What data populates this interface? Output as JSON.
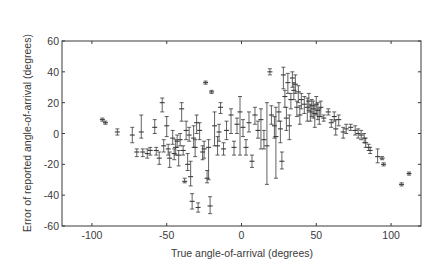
{
  "chart_data": {
    "type": "scatter",
    "subtype": "errorbar",
    "title": "",
    "xlabel": "True angle-of-arrival (degrees)",
    "ylabel": "Error of reported angle-of-arrival (degrees)",
    "xlim": [
      -120,
      120
    ],
    "ylim": [
      -60,
      60
    ],
    "xticks": [
      -100,
      -50,
      0,
      50,
      100
    ],
    "yticks": [
      -60,
      -40,
      -20,
      0,
      20,
      40,
      60
    ],
    "xtick_labels": [
      "-100",
      "-50",
      "0",
      "50",
      "100"
    ],
    "ytick_labels": [
      "-60",
      "-40",
      "-20",
      "0",
      "20",
      "40",
      "60"
    ],
    "grid": false,
    "legend": null,
    "series": [
      {
        "name": "measurements",
        "color": "#3a3a3a",
        "points": [
          {
            "x": -93,
            "y": 9,
            "lo": 8,
            "hi": 10
          },
          {
            "x": -91,
            "y": 7,
            "lo": 6,
            "hi": 8
          },
          {
            "x": -83,
            "y": 1,
            "lo": -1,
            "hi": 3
          },
          {
            "x": -73,
            "y": -1,
            "lo": -6,
            "hi": 4
          },
          {
            "x": -70,
            "y": -12,
            "lo": -15,
            "hi": -10
          },
          {
            "x": -67,
            "y": 1,
            "lo": -3,
            "hi": 12
          },
          {
            "x": -66,
            "y": -12,
            "lo": -15,
            "hi": -10
          },
          {
            "x": -63,
            "y": -13,
            "lo": -16,
            "hi": -10
          },
          {
            "x": -61,
            "y": -11,
            "lo": -14,
            "hi": -9
          },
          {
            "x": -58,
            "y": 4,
            "lo": 0,
            "hi": 9
          },
          {
            "x": -57,
            "y": -11,
            "lo": -14,
            "hi": -9
          },
          {
            "x": -55,
            "y": -16,
            "lo": -20,
            "hi": -12
          },
          {
            "x": -53,
            "y": 20,
            "lo": 14,
            "hi": 23
          },
          {
            "x": -52,
            "y": -8,
            "lo": -12,
            "hi": -4
          },
          {
            "x": -50,
            "y": 5,
            "lo": -2,
            "hi": 11
          },
          {
            "x": -49,
            "y": -10,
            "lo": -14,
            "hi": -7
          },
          {
            "x": -48,
            "y": -16,
            "lo": -22,
            "hi": -12
          },
          {
            "x": -46,
            "y": -3,
            "lo": -7,
            "hi": 2
          },
          {
            "x": -45,
            "y": -13,
            "lo": -17,
            "hi": -10
          },
          {
            "x": -44,
            "y": -9,
            "lo": -14,
            "hi": -4
          },
          {
            "x": -43,
            "y": -5,
            "lo": -9,
            "hi": -1
          },
          {
            "x": -42,
            "y": -14,
            "lo": -21,
            "hi": -11
          },
          {
            "x": -41,
            "y": -4,
            "lo": -8,
            "hi": 0
          },
          {
            "x": -40,
            "y": 16,
            "lo": 8,
            "hi": 20
          },
          {
            "x": -39,
            "y": -11,
            "lo": -14,
            "hi": -8
          },
          {
            "x": -38,
            "y": -31,
            "lo": -32,
            "hi": -29
          },
          {
            "x": -37,
            "y": 2,
            "lo": -4,
            "hi": 8
          },
          {
            "x": -36,
            "y": -20,
            "lo": -24,
            "hi": -13
          },
          {
            "x": -35,
            "y": -1,
            "lo": -5,
            "hi": 4
          },
          {
            "x": -34,
            "y": -28,
            "lo": -34,
            "hi": -18
          },
          {
            "x": -33,
            "y": -44,
            "lo": -49,
            "hi": -39
          },
          {
            "x": -32,
            "y": -3,
            "lo": -9,
            "hi": 5
          },
          {
            "x": -31,
            "y": -9,
            "lo": -15,
            "hi": -4
          },
          {
            "x": -30,
            "y": 7,
            "lo": 0,
            "hi": 12
          },
          {
            "x": -29,
            "y": -48,
            "lo": -51,
            "hi": -45
          },
          {
            "x": -28,
            "y": 2,
            "lo": -4,
            "hi": 7
          },
          {
            "x": -26,
            "y": -12,
            "lo": -17,
            "hi": -8
          },
          {
            "x": -25,
            "y": -10,
            "lo": -16,
            "hi": -5
          },
          {
            "x": -24,
            "y": 33,
            "lo": 32,
            "hi": 34
          },
          {
            "x": -23,
            "y": -29,
            "lo": -32,
            "hi": -24
          },
          {
            "x": -22,
            "y": -9,
            "lo": -30,
            "hi": -4
          },
          {
            "x": -21,
            "y": -47,
            "lo": -52,
            "hi": -41
          },
          {
            "x": -20,
            "y": 27,
            "lo": 26,
            "hi": 28
          },
          {
            "x": -18,
            "y": 5,
            "lo": -8,
            "hi": 14
          },
          {
            "x": -16,
            "y": -8,
            "lo": -14,
            "hi": -2
          },
          {
            "x": -15,
            "y": 1,
            "lo": -5,
            "hi": 6
          },
          {
            "x": -14,
            "y": 17,
            "lo": 13,
            "hi": 20
          },
          {
            "x": -12,
            "y": -10,
            "lo": -14,
            "hi": -6
          },
          {
            "x": -10,
            "y": 2,
            "lo": -4,
            "hi": 8
          },
          {
            "x": -7,
            "y": 12,
            "lo": 0,
            "hi": 16
          },
          {
            "x": -5,
            "y": -9,
            "lo": -14,
            "hi": -5
          },
          {
            "x": -3,
            "y": 6,
            "lo": 0,
            "hi": 10
          },
          {
            "x": -1,
            "y": 14,
            "lo": -14,
            "hi": 24
          },
          {
            "x": 1,
            "y": 4,
            "lo": -2,
            "hi": 9
          },
          {
            "x": 3,
            "y": -9,
            "lo": -14,
            "hi": -4
          },
          {
            "x": 5,
            "y": 7,
            "lo": 1,
            "hi": 14
          },
          {
            "x": 7,
            "y": -18,
            "lo": -22,
            "hi": -14
          },
          {
            "x": 9,
            "y": 12,
            "lo": 6,
            "hi": 17
          },
          {
            "x": 11,
            "y": 2,
            "lo": -3,
            "hi": 8
          },
          {
            "x": 13,
            "y": 9,
            "lo": -10,
            "hi": 16
          },
          {
            "x": 15,
            "y": -4,
            "lo": -10,
            "hi": 2
          },
          {
            "x": 17,
            "y": -8,
            "lo": -33,
            "hi": 20
          },
          {
            "x": 19,
            "y": 40,
            "lo": 38,
            "hi": 42
          },
          {
            "x": 20,
            "y": 12,
            "lo": 6,
            "hi": 18
          },
          {
            "x": 22,
            "y": 5,
            "lo": -3,
            "hi": 11
          },
          {
            "x": 23,
            "y": -2,
            "lo": -29,
            "hi": 17
          },
          {
            "x": 25,
            "y": 14,
            "lo": 8,
            "hi": 20
          },
          {
            "x": 26,
            "y": 3,
            "lo": -6,
            "hi": 8
          },
          {
            "x": 27,
            "y": -18,
            "lo": -23,
            "hi": -12
          },
          {
            "x": 28,
            "y": 38,
            "lo": 29,
            "hi": 43
          },
          {
            "x": 29,
            "y": 24,
            "lo": 17,
            "hi": 28
          },
          {
            "x": 30,
            "y": 10,
            "lo": 2,
            "hi": 17
          },
          {
            "x": 31,
            "y": 33,
            "lo": 26,
            "hi": 39
          },
          {
            "x": 32,
            "y": 5,
            "lo": -4,
            "hi": 12
          },
          {
            "x": 33,
            "y": 22,
            "lo": 16,
            "hi": 26
          },
          {
            "x": 34,
            "y": 36,
            "lo": 30,
            "hi": 40
          },
          {
            "x": 35,
            "y": 28,
            "lo": 22,
            "hi": 33
          },
          {
            "x": 36,
            "y": 32,
            "lo": 26,
            "hi": 38
          },
          {
            "x": 37,
            "y": 17,
            "lo": 11,
            "hi": 21
          },
          {
            "x": 38,
            "y": 27,
            "lo": 20,
            "hi": 31
          },
          {
            "x": 39,
            "y": 12,
            "lo": 6,
            "hi": 18
          },
          {
            "x": 40,
            "y": 22,
            "lo": 16,
            "hi": 26
          },
          {
            "x": 42,
            "y": 19,
            "lo": 13,
            "hi": 24
          },
          {
            "x": 44,
            "y": 17,
            "lo": 8,
            "hi": 23
          },
          {
            "x": 45,
            "y": 21,
            "lo": 15,
            "hi": 26
          },
          {
            "x": 46,
            "y": 14,
            "lo": 8,
            "hi": 19
          },
          {
            "x": 47,
            "y": 18,
            "lo": 11,
            "hi": 22
          },
          {
            "x": 48,
            "y": 16,
            "lo": 10,
            "hi": 21
          },
          {
            "x": 49,
            "y": 13,
            "lo": 4,
            "hi": 18
          },
          {
            "x": 50,
            "y": 19,
            "lo": 12,
            "hi": 24
          },
          {
            "x": 51,
            "y": 15,
            "lo": 9,
            "hi": 20
          },
          {
            "x": 52,
            "y": 11,
            "lo": 6,
            "hi": 16
          },
          {
            "x": 53,
            "y": 17,
            "lo": 11,
            "hi": 21
          },
          {
            "x": 55,
            "y": 10,
            "lo": 8,
            "hi": 12
          },
          {
            "x": 58,
            "y": 14,
            "lo": 12,
            "hi": 16
          },
          {
            "x": 60,
            "y": 7,
            "lo": 4,
            "hi": 9
          },
          {
            "x": 62,
            "y": 11,
            "lo": 8,
            "hi": 14
          },
          {
            "x": 63,
            "y": 3,
            "lo": -1,
            "hi": 9
          },
          {
            "x": 65,
            "y": 9,
            "lo": 5,
            "hi": 12
          },
          {
            "x": 68,
            "y": 1,
            "lo": -3,
            "hi": 4
          },
          {
            "x": 70,
            "y": 3,
            "lo": 0,
            "hi": 6
          },
          {
            "x": 73,
            "y": 4,
            "lo": 2,
            "hi": 6
          },
          {
            "x": 76,
            "y": 2,
            "lo": -1,
            "hi": 5
          },
          {
            "x": 78,
            "y": 0,
            "lo": -3,
            "hi": 3
          },
          {
            "x": 80,
            "y": -1,
            "lo": -4,
            "hi": 2
          },
          {
            "x": 82,
            "y": -3,
            "lo": -6,
            "hi": 0
          },
          {
            "x": 83,
            "y": -6,
            "lo": -9,
            "hi": -3
          },
          {
            "x": 85,
            "y": -9,
            "lo": -11,
            "hi": -7
          },
          {
            "x": 86,
            "y": -11,
            "lo": -13,
            "hi": -9
          },
          {
            "x": 91,
            "y": -15,
            "lo": -19,
            "hi": -10
          },
          {
            "x": 94,
            "y": -16,
            "lo": -17,
            "hi": -15
          },
          {
            "x": 95,
            "y": -20,
            "lo": -21,
            "hi": -19
          },
          {
            "x": 107,
            "y": -33,
            "lo": -34,
            "hi": -32
          },
          {
            "x": 112,
            "y": -26,
            "lo": -27,
            "hi": -25
          }
        ]
      }
    ]
  }
}
